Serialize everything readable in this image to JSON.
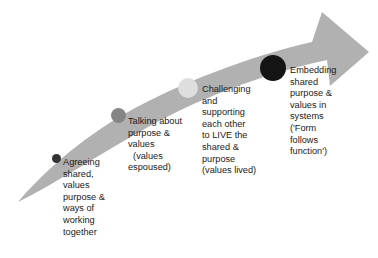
{
  "diagram": {
    "arrow": {
      "name": "upward-sweeping-arrow",
      "color": "#b1b1b1",
      "direction": "left-bottom to right-top"
    },
    "stages": [
      {
        "id": "stage-1",
        "marker": {
          "name": "stage-marker-1",
          "color": "#333333",
          "size": 9
        },
        "text": "Agreeing\nshared,\nvalues\npurpose &\nways of\nworking\ntogether"
      },
      {
        "id": "stage-2",
        "marker": {
          "name": "stage-marker-2",
          "color": "#868686",
          "size": 15
        },
        "text": "Talking about\npurpose &\nvalues\n  (values\nespoused)"
      },
      {
        "id": "stage-3",
        "marker": {
          "name": "stage-marker-3",
          "color": "#dedede",
          "size": 20
        },
        "text": "Challenging\nand\nsupporting\neach other\nto LIVE the\nshared &\npurpose\n(values lived)"
      },
      {
        "id": "stage-4",
        "marker": {
          "name": "stage-marker-4",
          "color": "#141414",
          "size": 26
        },
        "text": "Embedding\nshared\npurpose &\nvalues in\nsystems\n('Form\nfollows\nfunction')"
      }
    ]
  }
}
